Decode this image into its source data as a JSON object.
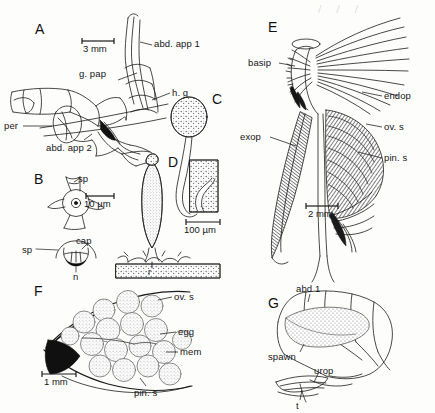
{
  "figure": {
    "background_color": "#fdfdfc",
    "ink_color": "#1a1a1a",
    "stipple_color": "#8e8e8e"
  },
  "artifact": {
    "text": "/ / /"
  },
  "panels": [
    {
      "id": "A",
      "letter": "A",
      "scale_bar": {
        "label": "3 mm"
      },
      "labels": [
        {
          "key": "abd_app_1",
          "text": "abd. app 1"
        },
        {
          "key": "g_pap",
          "text": "g. pap"
        },
        {
          "key": "h_g",
          "text": "h. g"
        },
        {
          "key": "per",
          "text": "per"
        },
        {
          "key": "abd_app_2",
          "text": "abd. app 2"
        }
      ]
    },
    {
      "id": "B",
      "letter": "B",
      "scale_bar": {
        "label": "10 µm"
      },
      "labels": [
        {
          "key": "sp_top",
          "text": "sp"
        },
        {
          "key": "cap",
          "text": "cap"
        },
        {
          "key": "sp_low",
          "text": "sp"
        },
        {
          "key": "n",
          "text": "n"
        }
      ]
    },
    {
      "id": "C",
      "letter": "C",
      "scale_bar": {
        "label": "100 µm"
      },
      "labels": []
    },
    {
      "id": "D",
      "letter": "D",
      "scale_bar": null,
      "labels": [
        {
          "key": "r",
          "text": "r"
        }
      ]
    },
    {
      "id": "E",
      "letter": "E",
      "scale_bar": {
        "label": "2 mm"
      },
      "labels": [
        {
          "key": "basip",
          "text": "basip"
        },
        {
          "key": "endop",
          "text": "endop"
        },
        {
          "key": "exop",
          "text": "exop"
        },
        {
          "key": "ov_s",
          "text": "ov. s"
        },
        {
          "key": "pin_s",
          "text": "pin. s"
        }
      ]
    },
    {
      "id": "F",
      "letter": "F",
      "scale_bar": {
        "label": "1 mm"
      },
      "labels": [
        {
          "key": "ov_s",
          "text": "ov. s"
        },
        {
          "key": "egg",
          "text": "egg"
        },
        {
          "key": "mem",
          "text": "mem"
        },
        {
          "key": "pin_s",
          "text": "pin. s"
        }
      ]
    },
    {
      "id": "G",
      "letter": "G",
      "scale_bar": null,
      "labels": [
        {
          "key": "abd_1",
          "text": "abd 1"
        },
        {
          "key": "spawn",
          "text": "spawn"
        },
        {
          "key": "urop",
          "text": "urop"
        },
        {
          "key": "t",
          "text": "t"
        }
      ]
    }
  ]
}
